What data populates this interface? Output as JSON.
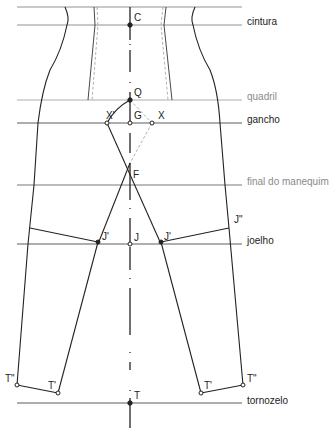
{
  "diagram": {
    "type": "trouser pattern construction",
    "levels": [
      {
        "label": "",
        "y": 7
      },
      {
        "label": "cintura",
        "y": 25
      },
      {
        "label": "quadril",
        "y": 100,
        "muted": true
      },
      {
        "label": "gancho",
        "y": 123
      },
      {
        "label": "final do manequim",
        "y": 185,
        "muted": true
      },
      {
        "label": "joelho",
        "y": 244
      },
      {
        "label": "tornozelo",
        "y": 403
      }
    ],
    "points": {
      "C": "C",
      "Q": "Q",
      "G": "G",
      "X": "X",
      "X_prime": "X'",
      "F": "F",
      "J": "J",
      "J_prime_left": "J'",
      "J_prime_right": "J'",
      "J_double_prime": "J\"",
      "T": "T",
      "T_prime_left": "T'",
      "T_prime_right": "T'",
      "T_double_prime_left": "T\"",
      "T_double_prime_right": "T\""
    },
    "colors": {
      "line": "#222222",
      "guide": "#7a7a7a",
      "dashed": "#a0a0a0",
      "muted_label": "#8a8a8a"
    }
  }
}
